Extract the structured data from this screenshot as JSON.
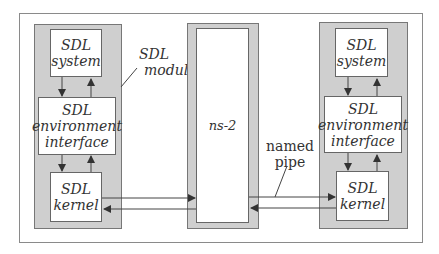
{
  "diagram": {
    "left_module": {
      "label": [
        "SDL",
        "module"
      ],
      "system": [
        "SDL",
        "system"
      ],
      "env": [
        "SDL",
        "environment",
        "interface"
      ],
      "kernel": [
        "SDL",
        "kernel"
      ]
    },
    "simulator": {
      "label": "ns-2"
    },
    "right_module": {
      "system": [
        "SDL",
        "system"
      ],
      "env": [
        "SDL",
        "environment",
        "interface"
      ],
      "kernel": [
        "SDL",
        "kernel"
      ]
    },
    "pipe_label": [
      "named",
      "pipe"
    ],
    "colors": {
      "module_fill": "#cfcfcf",
      "box_fill": "#ffffff",
      "line": "#333333"
    }
  }
}
